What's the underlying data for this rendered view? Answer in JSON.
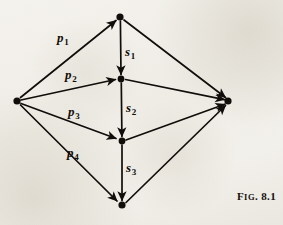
{
  "figure": {
    "caption_prefix": "F",
    "caption_smallcaps": "IG",
    "caption_period": ". ",
    "caption_number": "8.1",
    "caption_full": "Fig. 8.1",
    "background_color": "#f1efe9",
    "ink_color": "#100d0a"
  },
  "diagram": {
    "type": "directed-graph",
    "nodes": [
      {
        "id": "source",
        "name": "source-node",
        "x": 17,
        "y": 101,
        "r": 3.6
      },
      {
        "id": "n1",
        "name": "top-node",
        "x": 120,
        "y": 17,
        "r": 3.6
      },
      {
        "id": "n2",
        "name": "upper-middle-node",
        "x": 121,
        "y": 79,
        "r": 3.4
      },
      {
        "id": "n3",
        "name": "lower-middle-node",
        "x": 122,
        "y": 141,
        "r": 3.4
      },
      {
        "id": "n4",
        "name": "bottom-node",
        "x": 122,
        "y": 205,
        "r": 3.6
      },
      {
        "id": "sink",
        "name": "sink-node",
        "x": 228,
        "y": 101,
        "r": 3.6
      }
    ],
    "edges": [
      {
        "id": "e_p1",
        "from": "source",
        "to": "n1",
        "label": "p",
        "sub": "1"
      },
      {
        "id": "e_p2",
        "from": "source",
        "to": "n2",
        "label": "p",
        "sub": "2"
      },
      {
        "id": "e_p3",
        "from": "source",
        "to": "n3",
        "label": "p",
        "sub": "3"
      },
      {
        "id": "e_p4",
        "from": "source",
        "to": "n4",
        "label": "p",
        "sub": "4"
      },
      {
        "id": "e_s1",
        "from": "n1",
        "to": "n2",
        "label": "s",
        "sub": "1"
      },
      {
        "id": "e_s2",
        "from": "n2",
        "to": "n3",
        "label": "s",
        "sub": "2"
      },
      {
        "id": "e_s3",
        "from": "n3",
        "to": "n4",
        "label": "s",
        "sub": "3"
      },
      {
        "id": "e_r1",
        "from": "n1",
        "to": "sink",
        "label": "",
        "sub": ""
      },
      {
        "id": "e_r2",
        "from": "n2",
        "to": "sink",
        "label": "",
        "sub": ""
      },
      {
        "id": "e_r3",
        "from": "n3",
        "to": "sink",
        "label": "",
        "sub": ""
      },
      {
        "id": "e_r4",
        "from": "n4",
        "to": "sink",
        "label": "",
        "sub": ""
      }
    ],
    "labels": [
      {
        "id": "p1",
        "name": "edge-label-p1",
        "text": "p",
        "sub": "1",
        "x": 57,
        "y": 31
      },
      {
        "id": "p2",
        "name": "edge-label-p2",
        "text": "p",
        "sub": "2",
        "x": 65,
        "y": 68
      },
      {
        "id": "p3",
        "name": "edge-label-p3",
        "text": "p",
        "sub": "3",
        "x": 68,
        "y": 105
      },
      {
        "id": "p4",
        "name": "edge-label-p4",
        "text": "p",
        "sub": "4",
        "x": 67,
        "y": 146
      },
      {
        "id": "s1",
        "name": "edge-label-s1",
        "text": "s",
        "sub": "1",
        "x": 125,
        "y": 45
      },
      {
        "id": "s2",
        "name": "edge-label-s2",
        "text": "s",
        "sub": "2",
        "x": 126,
        "y": 101
      },
      {
        "id": "s3",
        "name": "edge-label-s3",
        "text": "s",
        "sub": "3",
        "x": 126,
        "y": 161
      }
    ]
  }
}
